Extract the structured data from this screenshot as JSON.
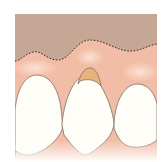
{
  "figure": {
    "title": "",
    "colors": {
      "background": "#ffffff",
      "bone_band": "#c7a898",
      "gum": "#f3c0a8",
      "gum_highlight": "#fbe2d4",
      "gum_deep": "#eeab92",
      "exposed_root": "#e9b27a",
      "tooth": "#fefdf8",
      "outline": "#7a7066",
      "dashed_line": "#3a2a22"
    },
    "elements": [
      {
        "name": "bone-level-dashed-line",
        "label": "original gum line"
      },
      {
        "name": "left-tooth"
      },
      {
        "name": "center-tooth",
        "note": "recession with exposed root"
      },
      {
        "name": "right-tooth"
      }
    ]
  }
}
